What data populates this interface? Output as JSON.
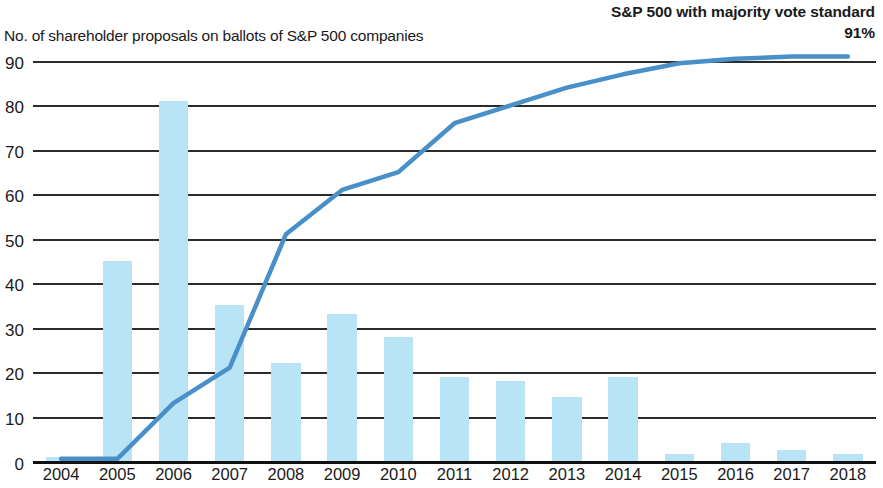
{
  "header": {
    "line_series_title": "S&P 500 with majority vote standard",
    "line_series_value": "91%",
    "bar_series_title": "No. of shareholder proposals on ballots of S&P 500 companies"
  },
  "colors": {
    "bar_fill": "#b9e4f6",
    "line_stroke": "#4a90c8",
    "gridline": "#2b2b2b",
    "text": "#1a1a1a"
  },
  "chart_data": {
    "type": "bar",
    "title": "No. of shareholder proposals on ballots of S&P 500 companies",
    "subtitle": "S&P 500 with majority vote standard 91%",
    "xlabel": "",
    "ylabel": "",
    "ylim": [
      0,
      90
    ],
    "ytick_labels": [
      "0",
      "10",
      "20",
      "30",
      "40",
      "50",
      "60",
      "70",
      "80",
      "90"
    ],
    "ytick_values": [
      0,
      10,
      20,
      30,
      40,
      50,
      60,
      70,
      80,
      90
    ],
    "grid": true,
    "legend_position": "none",
    "categories": [
      "2004",
      "2005",
      "2006",
      "2007",
      "2008",
      "2009",
      "2010",
      "2011",
      "2012",
      "2013",
      "2014",
      "2015",
      "2016",
      "2017",
      "2018"
    ],
    "series": [
      {
        "name": "No. of shareholder proposals on ballots of S&P 500 companies",
        "type": "bar",
        "color": "#b9e4f6",
        "values": [
          1,
          45,
          81,
          35,
          22,
          33,
          28,
          19,
          18,
          14.5,
          19,
          1.5,
          4,
          2.5,
          1.5
        ]
      },
      {
        "name": "S&P 500 with majority vote standard",
        "type": "line",
        "color": "#4a90c8",
        "unit": "%",
        "values": [
          0.5,
          0.5,
          13,
          21,
          51,
          61,
          65,
          76,
          80,
          84,
          87,
          89.5,
          90.5,
          91,
          91
        ]
      }
    ],
    "annotations": [
      {
        "text": "91%",
        "series": "S&P 500 with majority vote standard",
        "at": "2018"
      }
    ]
  }
}
